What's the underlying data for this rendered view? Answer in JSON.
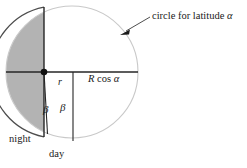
{
  "figure": {
    "background_color": "#ffffff",
    "ink_color": "#1a1a1a",
    "shade_color": "#b0b0b0",
    "arc_color": "#c8c8c8"
  },
  "labels": {
    "latitude_circle": "circle for latitude ",
    "latitude_circle_symbol": "α",
    "radius_small": "r",
    "radius_projected": "R",
    "radius_projected_rest": " cos ",
    "radius_projected_symbol": "α",
    "beta_left": "β",
    "beta_right": "β",
    "night": "night",
    "day": "day"
  },
  "geometry": {
    "circle_center_x": 72,
    "circle_center_y": 72,
    "circle_radius": 66,
    "terminator_x": 44,
    "center_dot_x": 44,
    "center_dot_y": 72,
    "center_dot_radius": 3.2,
    "chord_line_x": 73,
    "chord_line_bottom_y": 140,
    "slant_end_x": 47,
    "slant_end_y": 133,
    "horizontal_axis_y": 72,
    "arrow_tip_x": 122,
    "arrow_tip_y": 34,
    "arrow_tail_x": 150,
    "arrow_tail_y": 18
  }
}
